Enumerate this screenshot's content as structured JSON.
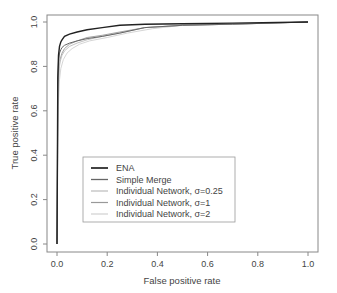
{
  "chart_data": {
    "type": "line",
    "title": "",
    "xlabel": "False positive rate",
    "ylabel": "True positive rate",
    "xlim": [
      0,
      1
    ],
    "ylim": [
      0,
      1
    ],
    "xticks": [
      "0.0",
      "0.2",
      "0.4",
      "0.6",
      "0.8",
      "1.0"
    ],
    "yticks": [
      "0.0",
      "0.2",
      "0.4",
      "0.6",
      "0.8",
      "1.0"
    ],
    "grid": false,
    "legend_position": "lower center-left",
    "series": [
      {
        "name": "ENA",
        "color": "#222222",
        "width": 1.4,
        "x": [
          0,
          0.003,
          0.006,
          0.01,
          0.015,
          0.02,
          0.03,
          0.05,
          0.08,
          0.12,
          0.18,
          0.25,
          0.35,
          0.5,
          0.7,
          1.0
        ],
        "y": [
          0,
          0.75,
          0.85,
          0.89,
          0.91,
          0.92,
          0.935,
          0.945,
          0.955,
          0.965,
          0.975,
          0.985,
          0.99,
          0.992,
          0.995,
          1.0
        ]
      },
      {
        "name": "Simple Merge",
        "color": "#666666",
        "width": 1.0,
        "x": [
          0,
          0.003,
          0.006,
          0.01,
          0.015,
          0.02,
          0.03,
          0.05,
          0.08,
          0.12,
          0.18,
          0.25,
          0.35,
          0.5,
          0.7,
          1.0
        ],
        "y": [
          0,
          0.72,
          0.82,
          0.86,
          0.875,
          0.885,
          0.895,
          0.905,
          0.915,
          0.925,
          0.935,
          0.95,
          0.975,
          0.985,
          0.99,
          1.0
        ]
      },
      {
        "name": "Individual Network, σ=0.25",
        "color": "#bbbbbb",
        "width": 0.9,
        "x": [
          0,
          0.004,
          0.008,
          0.012,
          0.02,
          0.03,
          0.05,
          0.08,
          0.12,
          0.18,
          0.25,
          0.35,
          0.5,
          0.7,
          1.0
        ],
        "y": [
          0,
          0.68,
          0.78,
          0.82,
          0.85,
          0.87,
          0.89,
          0.905,
          0.92,
          0.935,
          0.95,
          0.975,
          0.985,
          0.99,
          1.0
        ]
      },
      {
        "name": "Individual Network, σ=1",
        "color": "#999999",
        "width": 0.9,
        "x": [
          0,
          0.004,
          0.008,
          0.012,
          0.02,
          0.03,
          0.05,
          0.08,
          0.12,
          0.18,
          0.25,
          0.35,
          0.5,
          0.7,
          1.0
        ],
        "y": [
          0,
          0.7,
          0.79,
          0.83,
          0.86,
          0.88,
          0.9,
          0.915,
          0.93,
          0.94,
          0.955,
          0.975,
          0.985,
          0.99,
          1.0
        ]
      },
      {
        "name": "Individual Network, σ=2",
        "color": "#d0d0d0",
        "width": 0.9,
        "x": [
          0,
          0.005,
          0.01,
          0.015,
          0.025,
          0.04,
          0.06,
          0.09,
          0.13,
          0.2,
          0.28,
          0.38,
          0.5,
          0.7,
          1.0
        ],
        "y": [
          0,
          0.62,
          0.74,
          0.79,
          0.83,
          0.86,
          0.88,
          0.9,
          0.915,
          0.93,
          0.95,
          0.97,
          0.985,
          0.99,
          1.0
        ]
      }
    ]
  }
}
